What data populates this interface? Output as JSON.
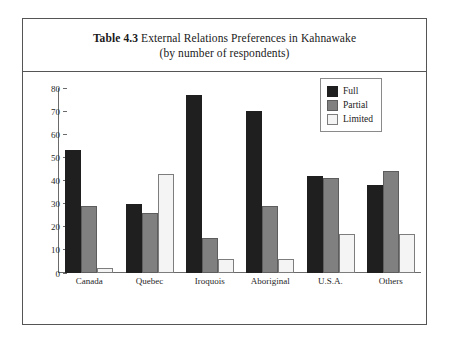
{
  "figure": {
    "title_main": "Table 4.3",
    "title_rest": " External Relations Preferences in Kahnawake",
    "title_sub": "(by number of respondents)"
  },
  "legend": {
    "position": "top-right",
    "items": [
      {
        "label": "Full",
        "color": "#201f1f",
        "swatch": "full"
      },
      {
        "label": "Partial",
        "color": "#808080",
        "swatch": "partial"
      },
      {
        "label": "Limited",
        "color": "#f4f4f4",
        "swatch": "limited"
      }
    ]
  },
  "axis": {
    "y_ticks": [
      "80",
      "70",
      "60",
      "50",
      "40",
      "30",
      "20",
      "10",
      "0"
    ]
  },
  "chart_data": {
    "type": "bar",
    "title": "Table 4.3 External Relations Preferences in Kahnawake (by number of respondents)",
    "xlabel": "",
    "ylabel": "",
    "ylim": [
      0,
      80
    ],
    "ytick_step": 10,
    "grid": false,
    "legend_position": "top-right",
    "categories": [
      "Canada",
      "Quebec",
      "Iroquois",
      "Aboriginal",
      "U.S.A.",
      "Others"
    ],
    "series": [
      {
        "name": "Full",
        "color": "#201f1f",
        "values": [
          53,
          30,
          77,
          70,
          42,
          38
        ]
      },
      {
        "name": "Partial",
        "color": "#808080",
        "values": [
          29,
          26,
          15,
          29,
          41,
          44
        ]
      },
      {
        "name": "Limited",
        "color": "#f4f4f4",
        "values": [
          2,
          43,
          6,
          6,
          17,
          17
        ]
      }
    ]
  }
}
